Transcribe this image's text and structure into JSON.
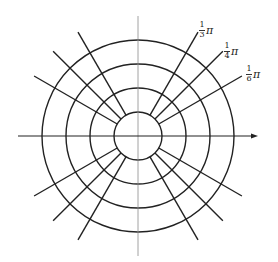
{
  "diagram": {
    "type": "polar-coordinate-grid",
    "center": [
      138,
      136
    ],
    "circle_radii": [
      24,
      48,
      72,
      96
    ],
    "radial_lines": {
      "inner_radius": 24,
      "outer_radius": 120,
      "angles_deg": [
        30,
        45,
        60,
        120,
        135,
        150,
        210,
        225,
        240,
        300,
        315,
        330
      ]
    },
    "axes": {
      "horizontal": {
        "x1": 18,
        "x2": 258,
        "y": 136,
        "arrow": true
      },
      "vertical": {
        "x": 138,
        "y1": 16,
        "y2": 256,
        "arrow": false
      }
    },
    "colors": {
      "stroke": "#222222",
      "axis_vertical": "#8a8a8a",
      "background": "#ffffff"
    }
  },
  "labels": [
    {
      "id": "third-pi",
      "numerator": "1",
      "denominator": "3",
      "symbol": "π",
      "x": 199,
      "y": 21
    },
    {
      "id": "quarter-pi",
      "numerator": "1",
      "denominator": "4",
      "symbol": "π",
      "x": 224,
      "y": 42
    },
    {
      "id": "sixth-pi",
      "numerator": "1",
      "denominator": "6",
      "symbol": "π",
      "x": 246,
      "y": 65
    }
  ]
}
